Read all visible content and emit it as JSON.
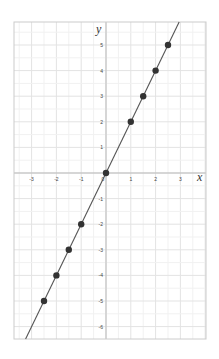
{
  "chart_data": {
    "type": "scatter",
    "title": "",
    "xlabel": "x",
    "ylabel": "y",
    "xlim": [
      -3.7,
      4.0
    ],
    "ylim": [
      -6.5,
      5.9
    ],
    "grid": true,
    "x_ticks": [
      -3,
      -2,
      -1,
      0,
      1,
      2,
      3
    ],
    "y_ticks": [
      -6,
      -5,
      -4,
      -3,
      -2,
      -1,
      1,
      2,
      3,
      4,
      5
    ],
    "x_tick_labels": [
      "-3",
      "-2",
      "-1",
      "0",
      "1",
      "2",
      "3"
    ],
    "y_tick_labels": [
      "-6",
      "-5",
      "-4",
      "-3",
      "-2",
      "-1",
      "1",
      "2",
      "3",
      "4",
      "5"
    ],
    "series": [
      {
        "name": "points",
        "x": [
          -2.5,
          -2,
          -1.5,
          -1,
          0,
          1,
          1.5,
          2,
          2.5
        ],
        "y": [
          -5,
          -4,
          -3,
          -2,
          0,
          2,
          3,
          4,
          5
        ]
      },
      {
        "name": "line y = 2x",
        "type": "line",
        "slope": 2,
        "intercept": 0
      }
    ],
    "colors": {
      "line": "#555555",
      "points": "#333333",
      "grid": "#e3e3e3",
      "axis": "#bbbbbb",
      "frame": "#cccccc"
    }
  }
}
